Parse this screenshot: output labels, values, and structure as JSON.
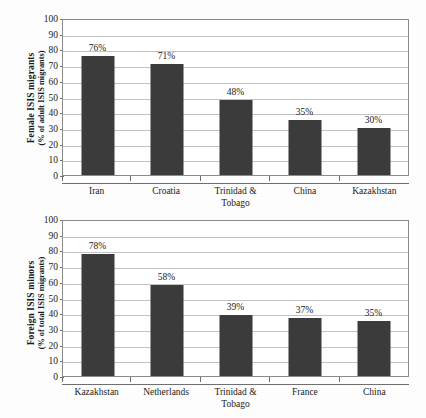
{
  "chart_data": [
    {
      "type": "bar",
      "id": "female-isis-migrants",
      "title": "",
      "xlabel": "",
      "ylabel_line1": "Female ISIS migrants",
      "ylabel_line2": "(% of adult ISIS migrants)",
      "ylim": [
        0,
        100
      ],
      "yticks": [
        100,
        90,
        80,
        70,
        60,
        50,
        40,
        30,
        20,
        10,
        0
      ],
      "grid": true,
      "legend": "none",
      "bar_color": "#3b3b3b",
      "categories": [
        "Iran",
        "Croatia",
        "Trinidad & Tobago",
        "China",
        "Kazakhstan"
      ],
      "values": [
        76,
        71,
        48,
        35,
        30
      ],
      "data_labels": [
        "76%",
        "71%",
        "48%",
        "35%",
        "30%"
      ]
    },
    {
      "type": "bar",
      "id": "foreign-isis-minors",
      "title": "",
      "xlabel": "",
      "ylabel_line1": "Foreign ISIS minors",
      "ylabel_line2": "(% of total ISIS migrants)",
      "ylim": [
        0,
        100
      ],
      "yticks": [
        100,
        90,
        80,
        70,
        60,
        50,
        40,
        30,
        20,
        10,
        0
      ],
      "grid": true,
      "legend": "none",
      "bar_color": "#3b3b3b",
      "categories": [
        "Kazakhstan",
        "Netherlands",
        "Trinidad & Tobago",
        "France",
        "China"
      ],
      "values": [
        78,
        58,
        39,
        37,
        35
      ],
      "data_labels": [
        "78%",
        "58%",
        "39%",
        "37%",
        "35%"
      ]
    }
  ]
}
